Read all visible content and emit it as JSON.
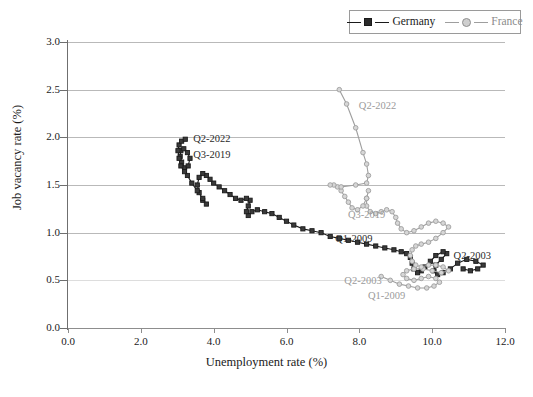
{
  "chart_data": {
    "type": "scatter",
    "title": "",
    "xlabel": "Unemployment rate (%)",
    "ylabel": "Job vacancy rate (%)",
    "xlim": [
      0.0,
      12.0
    ],
    "ylim": [
      0.0,
      3.0
    ],
    "xticks": [
      "0.0",
      "2.0",
      "4.0",
      "6.0",
      "8.0",
      "10.0",
      "12.0"
    ],
    "yticks": [
      "0.0",
      "0.5",
      "1.0",
      "1.5",
      "2.0",
      "2.5",
      "3.0"
    ],
    "grid": "horizontal",
    "legend_position": "top-right",
    "series": [
      {
        "name": "Germany",
        "color": "#1a1a1a",
        "marker": "square",
        "points": [
          [
            10.85,
            0.62
          ],
          [
            11.05,
            0.6
          ],
          [
            11.25,
            0.62
          ],
          [
            11.4,
            0.66
          ],
          [
            11.2,
            0.7
          ],
          [
            10.95,
            0.72
          ],
          [
            10.7,
            0.68
          ],
          [
            10.5,
            0.62
          ],
          [
            10.3,
            0.58
          ],
          [
            10.15,
            0.56
          ],
          [
            10.05,
            0.6
          ],
          [
            10.1,
            0.66
          ],
          [
            10.25,
            0.72
          ],
          [
            10.4,
            0.78
          ],
          [
            10.3,
            0.8
          ],
          [
            10.1,
            0.76
          ],
          [
            9.95,
            0.7
          ],
          [
            9.8,
            0.64
          ],
          [
            9.7,
            0.6
          ],
          [
            9.6,
            0.58
          ],
          [
            9.5,
            0.62
          ],
          [
            9.45,
            0.68
          ],
          [
            9.4,
            0.74
          ],
          [
            9.3,
            0.78
          ],
          [
            9.15,
            0.8
          ],
          [
            8.95,
            0.82
          ],
          [
            8.7,
            0.84
          ],
          [
            8.45,
            0.86
          ],
          [
            8.2,
            0.88
          ],
          [
            7.95,
            0.9
          ],
          [
            7.7,
            0.92
          ],
          [
            7.45,
            0.94
          ],
          [
            7.2,
            0.96
          ],
          [
            6.95,
            1.0
          ],
          [
            6.7,
            1.02
          ],
          [
            6.45,
            1.04
          ],
          [
            6.2,
            1.08
          ],
          [
            6.0,
            1.12
          ],
          [
            5.8,
            1.16
          ],
          [
            5.6,
            1.2
          ],
          [
            5.4,
            1.22
          ],
          [
            5.2,
            1.24
          ],
          [
            5.05,
            1.22
          ],
          [
            4.95,
            1.18
          ],
          [
            4.9,
            1.22
          ],
          [
            4.95,
            1.28
          ],
          [
            5.0,
            1.34
          ],
          [
            4.9,
            1.36
          ],
          [
            4.75,
            1.34
          ],
          [
            4.6,
            1.36
          ],
          [
            4.45,
            1.4
          ],
          [
            4.3,
            1.44
          ],
          [
            4.15,
            1.48
          ],
          [
            4.0,
            1.52
          ],
          [
            3.9,
            1.56
          ],
          [
            3.8,
            1.6
          ],
          [
            3.7,
            1.62
          ],
          [
            3.6,
            1.58
          ],
          [
            3.55,
            1.5
          ],
          [
            3.6,
            1.42
          ],
          [
            3.7,
            1.34
          ],
          [
            3.8,
            1.3
          ],
          [
            3.7,
            1.36
          ],
          [
            3.55,
            1.44
          ],
          [
            3.4,
            1.52
          ],
          [
            3.28,
            1.6
          ],
          [
            3.2,
            1.68
          ],
          [
            3.12,
            1.74
          ],
          [
            3.08,
            1.8
          ],
          [
            3.1,
            1.86
          ],
          [
            3.18,
            1.88
          ],
          [
            3.28,
            1.84
          ],
          [
            3.35,
            1.78
          ],
          [
            3.3,
            1.7
          ],
          [
            3.2,
            1.64
          ],
          [
            3.1,
            1.7
          ],
          [
            3.05,
            1.78
          ],
          [
            3.02,
            1.86
          ],
          [
            3.05,
            1.92
          ],
          [
            3.12,
            1.96
          ],
          [
            3.22,
            1.98
          ]
        ],
        "labels": [
          {
            "text": "Q2-2003",
            "x": 10.45,
            "y": 0.74
          },
          {
            "text": "Q1-2009",
            "x": 7.2,
            "y": 0.92
          },
          {
            "text": "Q3-2019",
            "x": 3.3,
            "y": 1.8
          },
          {
            "text": "Q2-2022",
            "x": 3.3,
            "y": 1.97
          }
        ]
      },
      {
        "name": "France",
        "color": "#9e9e9e",
        "marker": "circle",
        "points": [
          [
            8.6,
            0.54
          ],
          [
            8.85,
            0.5
          ],
          [
            9.1,
            0.46
          ],
          [
            9.35,
            0.44
          ],
          [
            9.6,
            0.42
          ],
          [
            9.85,
            0.42
          ],
          [
            10.05,
            0.44
          ],
          [
            10.2,
            0.48
          ],
          [
            10.1,
            0.52
          ],
          [
            9.9,
            0.54
          ],
          [
            9.7,
            0.52
          ],
          [
            9.5,
            0.5
          ],
          [
            9.3,
            0.52
          ],
          [
            9.2,
            0.56
          ],
          [
            9.3,
            0.6
          ],
          [
            9.5,
            0.62
          ],
          [
            9.75,
            0.62
          ],
          [
            10.0,
            0.6
          ],
          [
            10.25,
            0.58
          ],
          [
            10.45,
            0.6
          ],
          [
            10.3,
            0.64
          ],
          [
            10.1,
            0.66
          ],
          [
            9.9,
            0.66
          ],
          [
            9.7,
            0.64
          ],
          [
            9.55,
            0.66
          ],
          [
            9.45,
            0.7
          ],
          [
            9.4,
            0.76
          ],
          [
            9.45,
            0.82
          ],
          [
            9.55,
            0.86
          ],
          [
            9.7,
            0.88
          ],
          [
            9.9,
            0.9
          ],
          [
            10.1,
            0.94
          ],
          [
            10.3,
            1.0
          ],
          [
            10.45,
            1.06
          ],
          [
            10.3,
            1.1
          ],
          [
            10.1,
            1.12
          ],
          [
            9.9,
            1.1
          ],
          [
            9.7,
            1.06
          ],
          [
            9.5,
            1.02
          ],
          [
            9.3,
            1.0
          ],
          [
            9.15,
            1.04
          ],
          [
            9.05,
            1.1
          ],
          [
            9.0,
            1.16
          ],
          [
            8.9,
            1.22
          ],
          [
            8.75,
            1.24
          ],
          [
            8.6,
            1.22
          ],
          [
            8.45,
            1.2
          ],
          [
            8.3,
            1.22
          ],
          [
            8.2,
            1.28
          ],
          [
            8.2,
            1.36
          ],
          [
            8.25,
            1.44
          ],
          [
            8.2,
            1.36
          ],
          [
            8.1,
            1.28
          ],
          [
            7.95,
            1.24
          ],
          [
            7.8,
            1.26
          ],
          [
            7.7,
            1.32
          ],
          [
            7.6,
            1.38
          ],
          [
            7.5,
            1.44
          ],
          [
            7.4,
            1.48
          ],
          [
            7.3,
            1.5
          ],
          [
            7.2,
            1.5
          ],
          [
            7.5,
            1.48
          ],
          [
            7.9,
            1.5
          ],
          [
            8.2,
            1.52
          ],
          [
            8.25,
            1.6
          ],
          [
            8.2,
            1.72
          ],
          [
            8.1,
            1.84
          ],
          [
            7.9,
            2.1
          ],
          [
            7.65,
            2.35
          ],
          [
            7.45,
            2.5
          ]
        ],
        "labels": [
          {
            "text": "Q1-2009",
            "x": 8.1,
            "y": 0.33
          },
          {
            "text": "Q2-2003",
            "x": 7.45,
            "y": 0.48
          },
          {
            "text": "Q3-2019",
            "x": 7.55,
            "y": 1.18
          },
          {
            "text": "Q2-2022",
            "x": 7.85,
            "y": 2.32
          }
        ]
      }
    ]
  },
  "legend": {
    "germany": "Germany",
    "france": "France"
  }
}
